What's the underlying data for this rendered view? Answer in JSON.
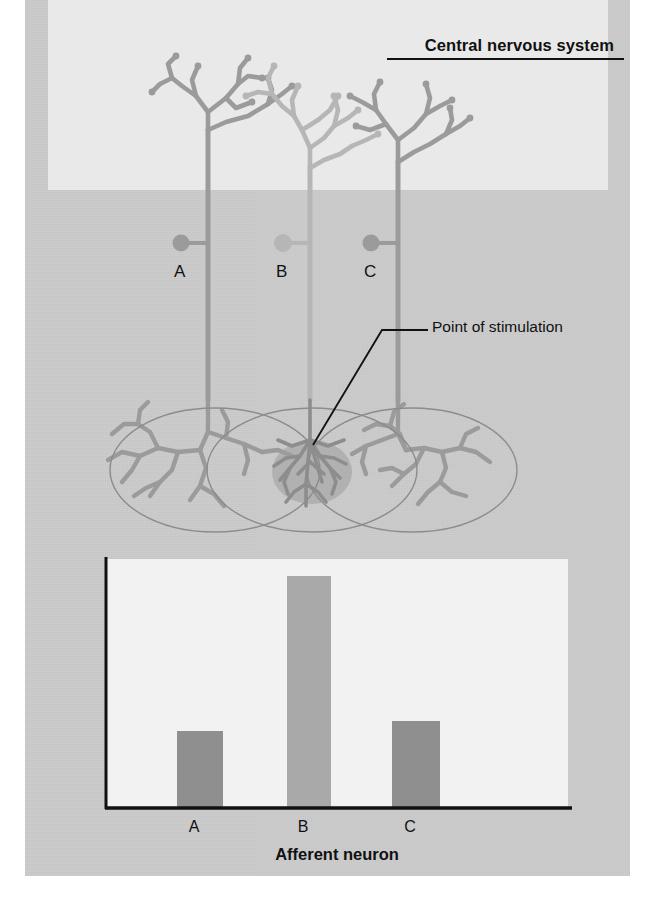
{
  "figure": {
    "cns_label": "Central nervous system",
    "callout_label": "Point of stimulation"
  },
  "neurons": [
    {
      "id": "A",
      "soma_label": "A",
      "color": "#9b9b9b",
      "axon_x": 208,
      "stimulated": false
    },
    {
      "id": "B",
      "soma_label": "B",
      "color": "#b6b6b6",
      "axon_x": 310,
      "stimulated": true
    },
    {
      "id": "C",
      "soma_label": "C",
      "color": "#9b9b9b",
      "axon_x": 398,
      "stimulated": false
    }
  ],
  "receptive_fields": [
    {
      "neuron": "A",
      "center_x": 215,
      "center_y": 470
    },
    {
      "neuron": "B",
      "center_x": 312,
      "center_y": 470
    },
    {
      "neuron": "C",
      "center_x": 412,
      "center_y": 470
    }
  ],
  "chart_data": {
    "type": "bar",
    "title": "",
    "categories": [
      "A",
      "B",
      "C"
    ],
    "values": [
      31,
      93,
      35
    ],
    "xlabel": "Afferent neuron",
    "ylabel": "Action-potential frequency",
    "ylim": [
      0,
      100
    ],
    "grid": false,
    "legend": null,
    "bar_colors": [
      "#8f8f8f",
      "#a9a9a9",
      "#8f8f8f"
    ],
    "axis_ticks_y": []
  },
  "colors": {
    "panel_bg": "#c9c9c9",
    "cns_bg": "#e9e9e9",
    "chart_bg": "#f2f2f2",
    "axis": "#111111",
    "neuron_dark": "#9b9b9b",
    "neuron_light": "#b6b6b6",
    "stimulus_blob": "#9a9a9a"
  }
}
